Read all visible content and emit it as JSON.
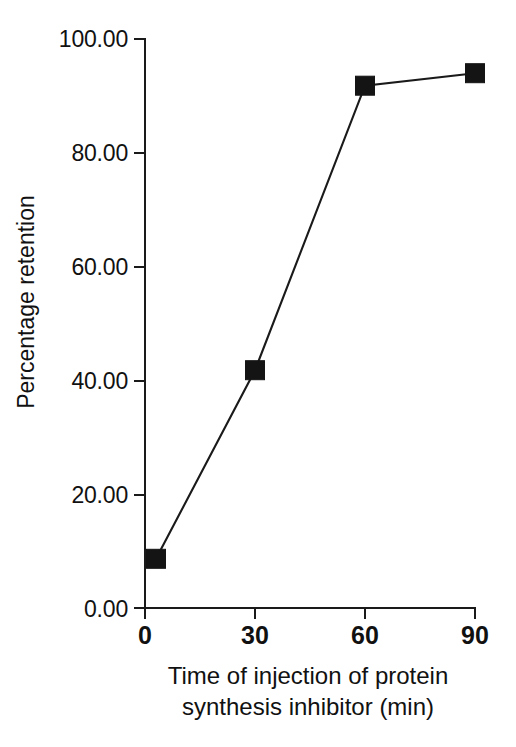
{
  "chart_data": {
    "type": "line",
    "title": "",
    "subtitle": "",
    "xlabel_lines": [
      "Time of injection of protein",
      "synthesis inhibitor (min)"
    ],
    "xlabel": "Time of injection of protein synthesis inhibitor (min)",
    "ylabel": "Percentage retention",
    "x": [
      3,
      30,
      60,
      90
    ],
    "values": [
      8.8,
      41.9,
      91.8,
      94.0
    ],
    "series": [
      {
        "name": "Percentage retention",
        "x": [
          3,
          30,
          60,
          90
        ],
        "values": [
          8.8,
          41.9,
          91.8,
          94.0
        ],
        "marker": "filled-square",
        "color": "#141414"
      }
    ],
    "xlim": [
      0,
      90
    ],
    "ylim": [
      0,
      100
    ],
    "xticks": [
      0,
      30,
      60,
      90
    ],
    "xtick_labels": [
      "0",
      "30",
      "60",
      "90"
    ],
    "yticks": [
      0,
      20,
      40,
      60,
      80,
      100
    ],
    "ytick_labels": [
      "0.00",
      "20.00",
      "40.00",
      "60.00",
      "80.00",
      "100.00"
    ],
    "grid": false,
    "legend": false,
    "legend_position": "none",
    "tick_direction": "out",
    "background_color": "#ffffff",
    "axis_color": "#1a1a1a"
  },
  "scan": {
    "bleed_text": ""
  }
}
